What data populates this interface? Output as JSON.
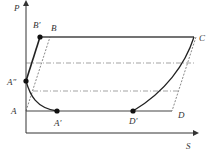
{
  "diagram": {
    "type": "P-S thermodynamic cycle diagram",
    "axes": {
      "y_label": "P",
      "x_label": "S"
    },
    "points": {
      "B_prime": "B′",
      "B": "B",
      "C": "C",
      "A_double_prime": "A″",
      "A": "A",
      "A_prime": "A′",
      "D_prime": "D′",
      "D": "D"
    },
    "colors": {
      "line": "#333333",
      "dash": "#555555",
      "dot": "#111111"
    }
  }
}
